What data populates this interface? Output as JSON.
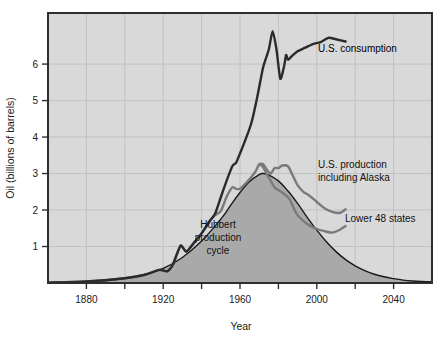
{
  "chart_data": {
    "type": "line",
    "title": "",
    "xlabel": "Year",
    "ylabel": "Oil (billions of barrels)",
    "xlim": [
      1860,
      2060
    ],
    "ylim": [
      0,
      7.4
    ],
    "xticks": [
      1880,
      1920,
      1960,
      2000,
      2040
    ],
    "xticks_minor": [
      1900,
      1940,
      1980,
      2020
    ],
    "yticks": [
      1,
      2,
      3,
      4,
      5,
      6
    ],
    "grid": true,
    "legend_position": "inline-annotations",
    "annotations": [
      {
        "text": "U.S. consumption",
        "x": 2005,
        "y": 6.25
      },
      {
        "text": "U.S. production",
        "x": 2025,
        "y": 3.3
      },
      {
        "text": "including Alaska",
        "x": 2025,
        "y": 2.95
      },
      {
        "text": "Lower 48 states",
        "x": 2028,
        "y": 1.75
      },
      {
        "text": "Hubbert",
        "x": 1963,
        "y": 1.55
      },
      {
        "text": "production",
        "x": 1963,
        "y": 1.28
      },
      {
        "text": "cycle",
        "x": 1963,
        "y": 1.01
      }
    ],
    "series": [
      {
        "name": "Hubbert production cycle",
        "style": "filled-curve",
        "color": "#1a1a1a",
        "fill": "#a9a9a9",
        "points": [
          [
            1860,
            0.01
          ],
          [
            1870,
            0.02
          ],
          [
            1880,
            0.04
          ],
          [
            1890,
            0.07
          ],
          [
            1900,
            0.13
          ],
          [
            1910,
            0.23
          ],
          [
            1920,
            0.4
          ],
          [
            1930,
            0.7
          ],
          [
            1940,
            1.15
          ],
          [
            1950,
            1.75
          ],
          [
            1955,
            2.12
          ],
          [
            1960,
            2.48
          ],
          [
            1965,
            2.78
          ],
          [
            1970,
            2.97
          ],
          [
            1972,
            3.0
          ],
          [
            1975,
            2.96
          ],
          [
            1980,
            2.8
          ],
          [
            1985,
            2.52
          ],
          [
            1990,
            2.18
          ],
          [
            1995,
            1.8
          ],
          [
            2000,
            1.45
          ],
          [
            2005,
            1.13
          ],
          [
            2010,
            0.86
          ],
          [
            2015,
            0.64
          ],
          [
            2020,
            0.47
          ],
          [
            2025,
            0.34
          ],
          [
            2030,
            0.24
          ],
          [
            2035,
            0.17
          ],
          [
            2040,
            0.12
          ],
          [
            2045,
            0.08
          ],
          [
            2050,
            0.055
          ],
          [
            2055,
            0.04
          ],
          [
            2060,
            0.03
          ]
        ]
      },
      {
        "name": "U.S. production including Alaska",
        "style": "line",
        "color": "#7a7a7a",
        "points": [
          [
            1860,
            0.01
          ],
          [
            1880,
            0.04
          ],
          [
            1900,
            0.13
          ],
          [
            1910,
            0.22
          ],
          [
            1918,
            0.36
          ],
          [
            1922,
            0.32
          ],
          [
            1925,
            0.5
          ],
          [
            1929,
            1.02
          ],
          [
            1932,
            0.86
          ],
          [
            1936,
            1.1
          ],
          [
            1940,
            1.36
          ],
          [
            1944,
            1.68
          ],
          [
            1947,
            1.86
          ],
          [
            1950,
            1.97
          ],
          [
            1953,
            2.36
          ],
          [
            1956,
            2.62
          ],
          [
            1958,
            2.58
          ],
          [
            1960,
            2.58
          ],
          [
            1962,
            2.68
          ],
          [
            1965,
            2.85
          ],
          [
            1968,
            3.05
          ],
          [
            1970,
            3.25
          ],
          [
            1972,
            3.26
          ],
          [
            1974,
            3.1
          ],
          [
            1976,
            3.0
          ],
          [
            1978,
            3.15
          ],
          [
            1980,
            3.15
          ],
          [
            1982,
            3.22
          ],
          [
            1985,
            3.2
          ],
          [
            1987,
            3.0
          ],
          [
            1990,
            2.68
          ],
          [
            1993,
            2.5
          ],
          [
            1996,
            2.4
          ],
          [
            2000,
            2.22
          ],
          [
            2004,
            2.05
          ],
          [
            2008,
            1.95
          ],
          [
            2012,
            1.92
          ],
          [
            2015,
            2.02
          ]
        ]
      },
      {
        "name": "Lower 48 states",
        "style": "line",
        "color": "#7a7a7a",
        "points": [
          [
            1970,
            3.25
          ],
          [
            1972,
            3.18
          ],
          [
            1974,
            2.98
          ],
          [
            1976,
            2.8
          ],
          [
            1978,
            2.62
          ],
          [
            1980,
            2.55
          ],
          [
            1982,
            2.48
          ],
          [
            1984,
            2.4
          ],
          [
            1986,
            2.28
          ],
          [
            1988,
            2.05
          ],
          [
            1990,
            1.86
          ],
          [
            1993,
            1.7
          ],
          [
            1996,
            1.58
          ],
          [
            2000,
            1.48
          ],
          [
            2004,
            1.42
          ],
          [
            2008,
            1.38
          ],
          [
            2012,
            1.46
          ],
          [
            2015,
            1.56
          ]
        ]
      },
      {
        "name": "U.S. consumption",
        "style": "line",
        "color": "#2b2b2b",
        "points": [
          [
            1860,
            0.01
          ],
          [
            1880,
            0.04
          ],
          [
            1900,
            0.13
          ],
          [
            1910,
            0.22
          ],
          [
            1918,
            0.36
          ],
          [
            1922,
            0.32
          ],
          [
            1925,
            0.5
          ],
          [
            1929,
            1.02
          ],
          [
            1932,
            0.86
          ],
          [
            1936,
            1.1
          ],
          [
            1940,
            1.36
          ],
          [
            1944,
            1.68
          ],
          [
            1947,
            1.9
          ],
          [
            1950,
            2.35
          ],
          [
            1953,
            2.8
          ],
          [
            1956,
            3.2
          ],
          [
            1958,
            3.3
          ],
          [
            1960,
            3.55
          ],
          [
            1963,
            3.95
          ],
          [
            1966,
            4.4
          ],
          [
            1969,
            5.1
          ],
          [
            1972,
            5.9
          ],
          [
            1975,
            6.4
          ],
          [
            1977,
            6.9
          ],
          [
            1979,
            6.4
          ],
          [
            1981,
            5.6
          ],
          [
            1983,
            5.95
          ],
          [
            1984,
            6.25
          ],
          [
            1985,
            6.12
          ],
          [
            1987,
            6.22
          ],
          [
            1990,
            6.35
          ],
          [
            1994,
            6.45
          ],
          [
            1998,
            6.55
          ],
          [
            2002,
            6.6
          ],
          [
            2006,
            6.72
          ],
          [
            2010,
            6.68
          ],
          [
            2015,
            6.62
          ]
        ]
      }
    ]
  },
  "axes": {
    "ylabel": "Oil (billions of barrels)",
    "xlabel": "Year",
    "xtick_labels": [
      "1880",
      "1920",
      "1960",
      "2000",
      "2040"
    ],
    "ytick_labels": [
      "1",
      "2",
      "3",
      "4",
      "5",
      "6"
    ]
  },
  "labels": {
    "consumption": "U.S. consumption",
    "production_line1": "U.S. production",
    "production_line2": "including Alaska",
    "lower48": "Lower 48 states",
    "hubbert_line1": "Hubbert",
    "hubbert_line2": "production",
    "hubbert_line3": "cycle"
  },
  "colors": {
    "plot_background": "#d9d9d9",
    "page_background": "#ffffff",
    "grid": "#c2c2c2",
    "frame": "#2e2e2e",
    "hubbert_fill": "#a9a9a9",
    "hubbert_stroke": "#1a1a1a",
    "production_line": "#7a7a7a",
    "consumption_line": "#2b2b2b",
    "text": "#111111"
  }
}
